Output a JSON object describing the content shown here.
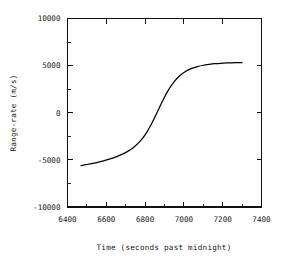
{
  "chart_data": {
    "type": "line",
    "title": "",
    "xlabel": "Time (seconds past midnight)",
    "ylabel": "Range-rate (m/s)",
    "xlim": [
      6400,
      7400
    ],
    "ylim": [
      -10000,
      10000
    ],
    "grid": false,
    "legend": false,
    "legend_position": "none",
    "x_major_ticks": [
      6400,
      6600,
      6800,
      7000,
      7200,
      7400
    ],
    "x_major_tick_labels": [
      "6400",
      "6600",
      "6800",
      "7000",
      "7200",
      "7400"
    ],
    "x_minor_ticks": [
      6500,
      6700,
      6900,
      7100,
      7300
    ],
    "y_major_ticks": [
      -10000,
      -5000,
      0,
      5000,
      10000
    ],
    "y_major_tick_labels": [
      "-10000",
      "-5000",
      "0",
      "5000",
      "10000"
    ],
    "y_minor_ticks": [
      -7500,
      -2500,
      2500,
      7500
    ],
    "series": [
      {
        "name": "Range-rate",
        "color": "#000000",
        "x": [
          6470,
          6500,
          6530,
          6560,
          6590,
          6620,
          6650,
          6680,
          6710,
          6740,
          6770,
          6800,
          6830,
          6860,
          6890,
          6920,
          6950,
          6980,
          7010,
          7040,
          7070,
          7100,
          7130,
          7160,
          7190,
          7220,
          7250,
          7280,
          7300
        ],
        "y": [
          -5600,
          -5490,
          -5370,
          -5230,
          -5070,
          -4890,
          -4680,
          -4420,
          -4100,
          -3680,
          -3120,
          -2350,
          -1300,
          -50,
          1250,
          2400,
          3300,
          3950,
          4400,
          4700,
          4900,
          5040,
          5130,
          5200,
          5250,
          5280,
          5300,
          5320,
          5330
        ]
      }
    ],
    "annotations": []
  },
  "axes": {
    "x_title": "Time (seconds past midnight)",
    "y_title": "Range-rate (m/s)"
  }
}
